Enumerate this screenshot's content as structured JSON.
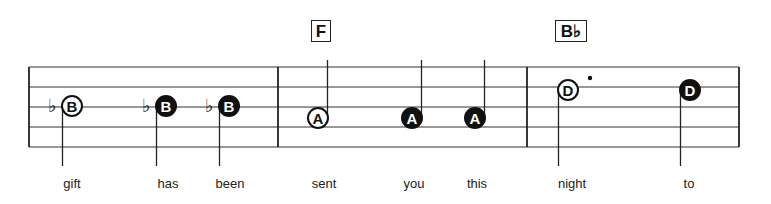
{
  "chords": [
    {
      "label": "F",
      "x": 311,
      "width": 20
    },
    {
      "label": "B♭",
      "x": 555,
      "width": 32
    }
  ],
  "staff": {
    "left": 29,
    "right": 739,
    "lines_y": [
      67,
      87,
      107,
      127,
      147
    ],
    "barlines_x": [
      278,
      527
    ],
    "line_color": "#333333"
  },
  "notes": [
    {
      "letter": "B",
      "x": 72,
      "y": 106,
      "filled": false,
      "flat": true,
      "stem": "down"
    },
    {
      "letter": "B",
      "x": 166,
      "y": 106,
      "filled": true,
      "flat": true,
      "stem": "down"
    },
    {
      "letter": "B",
      "x": 229,
      "y": 106,
      "filled": true,
      "flat": true,
      "stem": "down"
    },
    {
      "letter": "A",
      "x": 318,
      "y": 118,
      "filled": false,
      "flat": false,
      "stem": "up"
    },
    {
      "letter": "A",
      "x": 412,
      "y": 118,
      "filled": true,
      "flat": false,
      "stem": "up"
    },
    {
      "letter": "A",
      "x": 475,
      "y": 118,
      "filled": true,
      "flat": false,
      "stem": "up"
    },
    {
      "letter": "D",
      "x": 568,
      "y": 90,
      "filled": false,
      "flat": false,
      "stem": "down",
      "dotted": true
    },
    {
      "letter": "D",
      "x": 690,
      "y": 90,
      "filled": true,
      "flat": false,
      "stem": "down"
    }
  ],
  "lyrics": [
    {
      "text": "gift",
      "x": 72
    },
    {
      "text": "has",
      "x": 168
    },
    {
      "text": "been",
      "x": 230
    },
    {
      "text": "sent",
      "x": 324
    },
    {
      "text": "you",
      "x": 414
    },
    {
      "text": "this",
      "x": 477
    },
    {
      "text": "night",
      "x": 572
    },
    {
      "text": "to",
      "x": 689
    }
  ]
}
